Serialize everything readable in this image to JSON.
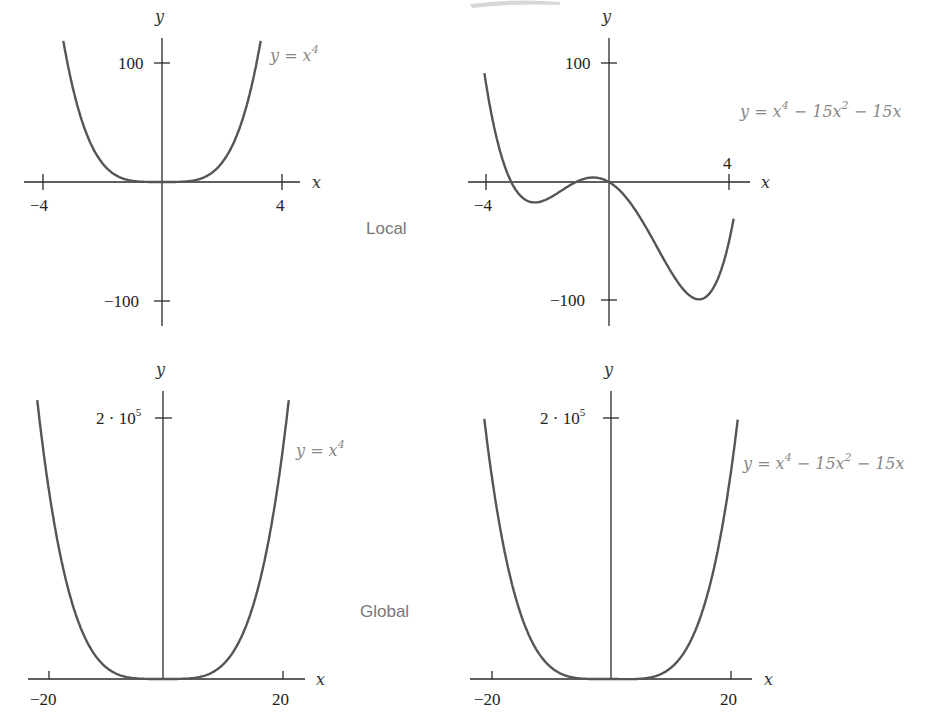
{
  "sections": {
    "local": "Local",
    "global": "Global"
  },
  "panels": [
    {
      "id": "local-x4",
      "axis_x_label": "x",
      "axis_y_label": "y",
      "x_ticks": [
        "−4",
        "4"
      ],
      "y_ticks": [
        "100",
        "−100"
      ],
      "equation": {
        "lhs": "y = x",
        "exp": "4"
      }
    },
    {
      "id": "local-poly",
      "axis_x_label": "x",
      "axis_y_label": "y",
      "x_ticks": [
        "−4",
        "4"
      ],
      "y_ticks": [
        "100",
        "−100"
      ],
      "equation": {
        "p1": "y = x",
        "e1": "4",
        "p2": " − 15x",
        "e2": "2",
        "p3": " − 15x"
      }
    },
    {
      "id": "global-x4",
      "axis_x_label": "x",
      "axis_y_label": "y",
      "x_ticks": [
        "−20",
        "20"
      ],
      "y_ticks": [
        {
          "base": "2 · 10",
          "exp": "5"
        }
      ],
      "equation": {
        "lhs": "y = x",
        "exp": "4"
      }
    },
    {
      "id": "global-poly",
      "axis_x_label": "x",
      "axis_y_label": "y",
      "x_ticks": [
        "−20",
        "20"
      ],
      "y_ticks": [
        {
          "base": "2 · 10",
          "exp": "5"
        }
      ],
      "equation": {
        "p1": "y = x",
        "e1": "4",
        "p2": " − 15x",
        "e2": "2",
        "p3": " − 15x"
      }
    }
  ],
  "colors": {
    "curve": "#555555",
    "axis": "#2a2a2a",
    "equation": "#888888",
    "section_label": "#777777"
  },
  "chart_data": [
    {
      "type": "line",
      "title": "Local view: y = x^4",
      "xlabel": "x",
      "ylabel": "y",
      "xlim": [
        -4.2,
        4.5
      ],
      "ylim": [
        -120,
        120
      ],
      "x_ticks": [
        -4,
        4
      ],
      "y_ticks": [
        100,
        -100
      ],
      "grid": false,
      "series": [
        {
          "name": "y = x^4",
          "x": [
            -3.3,
            -3,
            -2.5,
            -2,
            -1.5,
            -1,
            0,
            1,
            1.5,
            2,
            2.5,
            3,
            3.3
          ],
          "y": [
            118.6,
            81,
            39.1,
            16,
            5.1,
            1,
            0,
            1,
            5.1,
            16,
            39.1,
            81,
            118.6
          ]
        }
      ]
    },
    {
      "type": "line",
      "title": "Local view: y = x^4 − 15x^2 − 15x",
      "xlabel": "x",
      "ylabel": "y",
      "xlim": [
        -4.2,
        4.5
      ],
      "ylim": [
        -120,
        120
      ],
      "x_ticks": [
        -4,
        4
      ],
      "y_ticks": [
        100,
        -100
      ],
      "grid": false,
      "series": [
        {
          "name": "y = x^4 − 15x^2 − 15x",
          "x": [
            -4.15,
            -4,
            -3.5,
            -3,
            -2.5,
            -2,
            -1.5,
            -1,
            -0.5,
            0,
            1,
            2,
            2.5,
            3,
            3.5,
            4,
            4.1
          ],
          "y": [
            117.8,
            76,
            12.6,
            -9,
            -15.7,
            -14,
            -6.2,
            1,
            3.8,
            0,
            -29,
            -74,
            -96.3,
            -99,
            -73.4,
            -4,
            8.9
          ]
        }
      ]
    },
    {
      "type": "line",
      "title": "Global view: y = x^4",
      "xlabel": "x",
      "ylabel": "y",
      "xlim": [
        -22,
        22
      ],
      "ylim": [
        0,
        240000
      ],
      "x_ticks": [
        -20,
        20
      ],
      "y_ticks": [
        200000
      ],
      "grid": false,
      "series": [
        {
          "name": "y = x^4",
          "x": [
            -21.5,
            -20,
            -15,
            -10,
            -5,
            0,
            5,
            10,
            15,
            20,
            21.5
          ],
          "y": [
            213675,
            160000,
            50625,
            10000,
            625,
            0,
            625,
            10000,
            50625,
            160000,
            213675
          ]
        }
      ]
    },
    {
      "type": "line",
      "title": "Global view: y = x^4 − 15x^2 − 15x",
      "xlabel": "x",
      "ylabel": "y",
      "xlim": [
        -22,
        22
      ],
      "ylim": [
        0,
        240000
      ],
      "x_ticks": [
        -20,
        20
      ],
      "y_ticks": [
        200000
      ],
      "grid": false,
      "series": [
        {
          "name": "y = x^4 − 15x^2 − 15x",
          "x": [
            -21.5,
            -20,
            -15,
            -10,
            -5,
            0,
            5,
            10,
            15,
            20,
            21.5
          ],
          "y": [
            207062,
            154300,
            47475,
            8650,
            325,
            0,
            175,
            8350,
            46950,
            153700,
            206417
          ]
        }
      ]
    }
  ]
}
